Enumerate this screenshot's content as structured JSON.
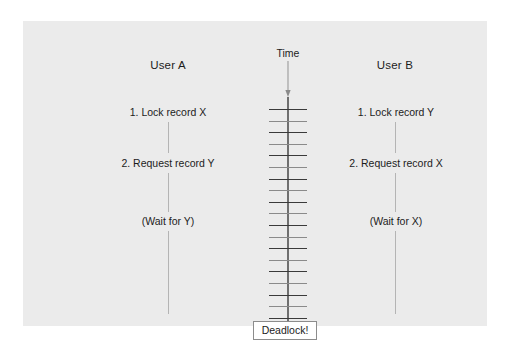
{
  "diagram": {
    "title_visible": false,
    "background_color": "#ffffff",
    "panel_color": "#ebebeb",
    "text_color": "#1c1c1c",
    "axis_color": "#6f6f6f",
    "tick_color": "#3a3a3a",
    "lifeline_color": "#b4b4b4"
  },
  "time_axis": {
    "label": "Time",
    "direction": "downward",
    "tick_count": 19,
    "tick_top_y": 88,
    "tick_spacing": 11.6
  },
  "columns": {
    "left": {
      "header": "User A",
      "steps": [
        {
          "text": "1. Lock record X",
          "y": 90
        },
        {
          "text": "2. Request record Y",
          "y": 141
        },
        {
          "text": "(Wait for Y)",
          "y": 199
        }
      ]
    },
    "right": {
      "header": "User B",
      "steps": [
        {
          "text": "1. Lock record Y",
          "y": 90
        },
        {
          "text": "2. Request record X",
          "y": 141
        },
        {
          "text": "(Wait for X)",
          "y": 199
        }
      ]
    }
  },
  "outcome": {
    "label": "Deadlock!",
    "box_fill": "#ffffff",
    "box_border": "#8c8c8c"
  }
}
